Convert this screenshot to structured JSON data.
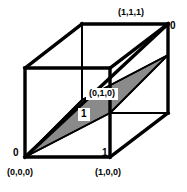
{
  "figure": {
    "name": "unit-cube-diagonal-plane",
    "colors": {
      "stroke": "#000000",
      "fill_shaded": "#8a8a8a",
      "background": "#ffffff",
      "label_box": "#ffffff"
    },
    "stroke_widths": {
      "outer_edge": 3.4,
      "inner_edge": 2.0,
      "plane_edge": 1.6
    }
  },
  "labels": {
    "corner_111": "(1,1,1)",
    "corner_000": "(0,0,0)",
    "corner_100": "(1,0,0)",
    "corner_010": "(0,1,0)",
    "axis_zero_top": "0",
    "axis_zero_bottom_left": "0",
    "axis_one_middle": "1",
    "axis_one_bottom_right": "1"
  },
  "geometry": {
    "projection": "oblique",
    "depth_offset": {
      "dx": 57,
      "dy": -44
    },
    "vertices": {
      "front_bottom_left": [
        25,
        157
      ],
      "front_bottom_right": [
        110,
        157
      ],
      "front_top_left": [
        25,
        68
      ],
      "front_top_right": [
        110,
        68
      ],
      "back_bottom_left": [
        82,
        113
      ],
      "back_bottom_right": [
        168,
        113
      ],
      "back_top_left": [
        82,
        24
      ],
      "back_top_right": [
        168,
        24
      ]
    },
    "shaded_plane": [
      [
        25,
        157
      ],
      [
        110,
        113
      ],
      [
        168,
        55
      ],
      [
        82,
        100
      ]
    ]
  }
}
